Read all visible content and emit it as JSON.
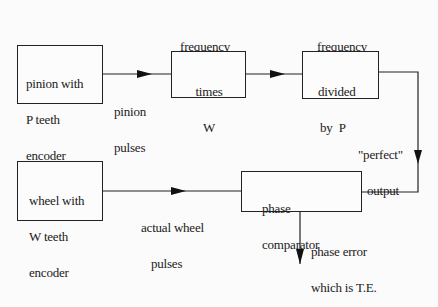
{
  "diagram": {
    "title": "",
    "nodes": {
      "pinion_encoder": {
        "lines": [
          "pinion with",
          "P teeth",
          "encoder"
        ]
      },
      "freq_multiplier": {
        "caption": [
          "frequency",
          "multiplier"
        ],
        "lines": [
          "times",
          "W"
        ]
      },
      "freq_divider": {
        "caption": [
          "frequency",
          "divider"
        ],
        "lines": [
          "divided",
          "by  P"
        ]
      },
      "wheel_encoder": {
        "lines": [
          "wheel with",
          "W teeth",
          "encoder"
        ]
      },
      "phase_comparator": {
        "lines": [
          "phase",
          "comparator"
        ]
      }
    },
    "edges": {
      "pinion_pulses": {
        "from": "pinion_encoder",
        "to": "freq_multiplier",
        "label": [
          "pinion",
          "pulses"
        ]
      },
      "mult_to_div": {
        "from": "freq_multiplier",
        "to": "freq_divider",
        "label": []
      },
      "perfect_output": {
        "from": "freq_divider",
        "to": "phase_comparator",
        "label": [
          "\"perfect\"",
          "output"
        ]
      },
      "actual_wheel_pulses": {
        "from": "wheel_encoder",
        "to": "phase_comparator",
        "label": [
          "actual wheel",
          "pulses"
        ]
      },
      "phase_error": {
        "from": "phase_comparator",
        "to": "output",
        "label": [
          "phase error",
          "which is T.E."
        ]
      }
    },
    "colors": {
      "stroke": "#222222",
      "background": "#fbfbfb",
      "text": "#1a1a1a"
    }
  }
}
